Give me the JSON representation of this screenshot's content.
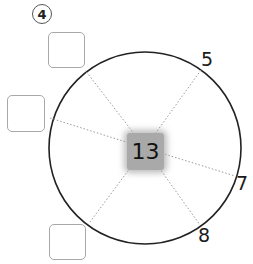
{
  "problem": {
    "number": "4"
  },
  "center": {
    "value": "13"
  },
  "outer_numbers": [
    {
      "position": "upper-right",
      "value": "5"
    },
    {
      "position": "right",
      "value": "7"
    },
    {
      "position": "lower-right",
      "value": "8"
    }
  ],
  "answer_boxes": [
    {
      "position": "upper-left",
      "value": ""
    },
    {
      "position": "left",
      "value": ""
    },
    {
      "position": "lower-left",
      "value": ""
    }
  ],
  "colors": {
    "circle_stroke": "#222222",
    "spoke": "#999999",
    "center_fill": "#a9a9a9",
    "box_border": "#a8a8a8"
  }
}
